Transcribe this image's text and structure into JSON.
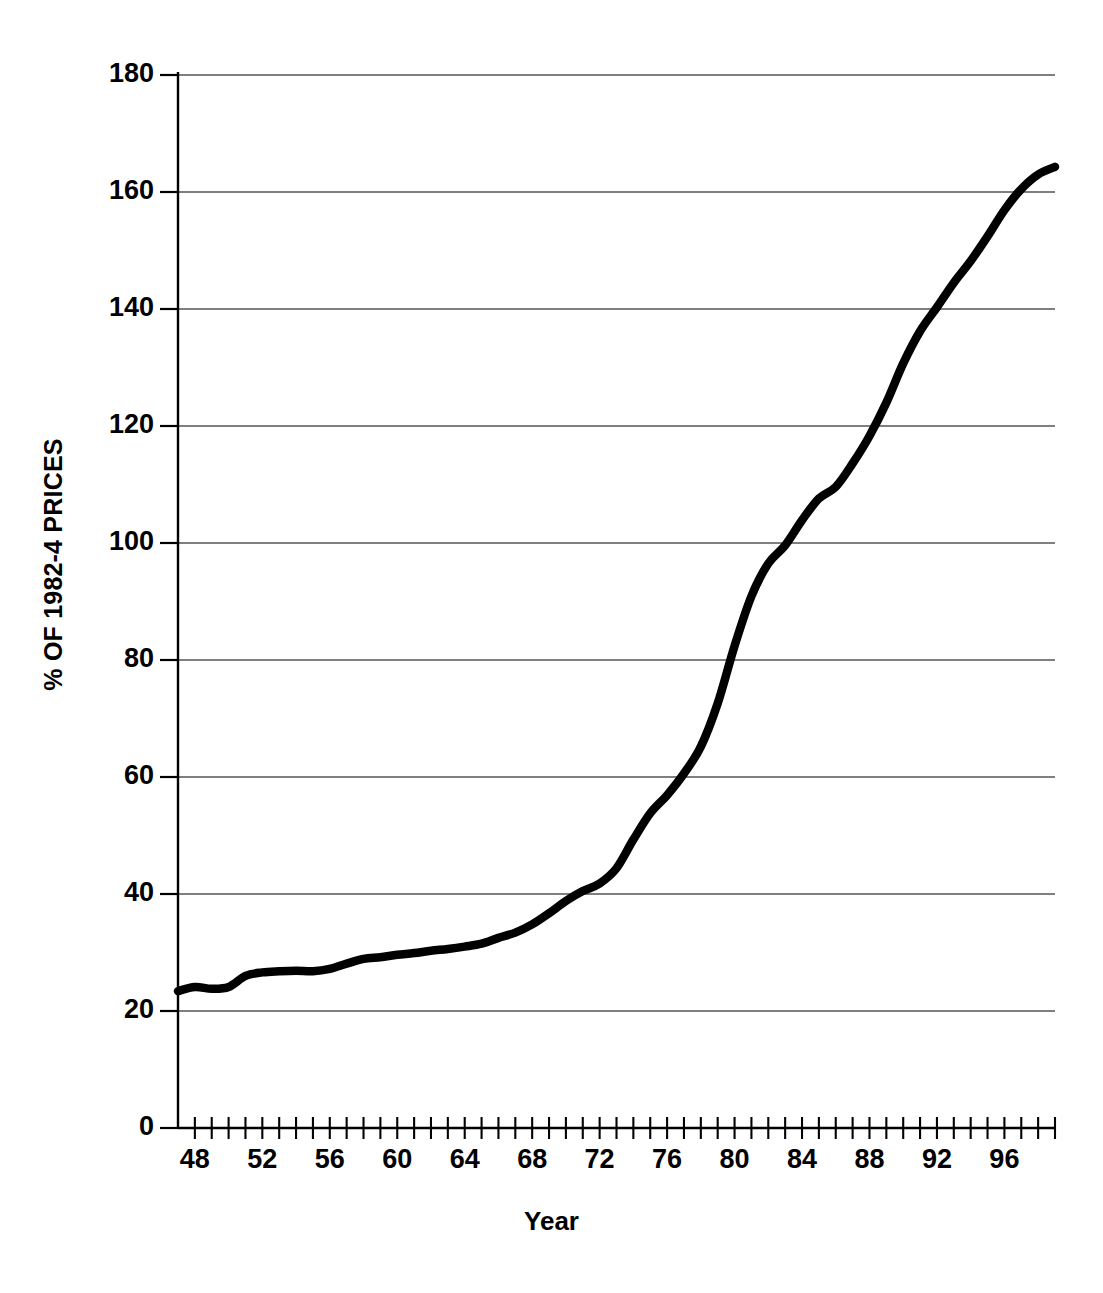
{
  "chart_data": {
    "type": "line",
    "title": "",
    "xlabel": "Year",
    "ylabel": "% OF 1982-4 PRICES",
    "xlim": [
      47,
      99
    ],
    "ylim": [
      0,
      180
    ],
    "grid": true,
    "legend": false,
    "legend_position": "none",
    "line_color": "#000000",
    "x_tick_labels": [
      "48",
      "52",
      "56",
      "60",
      "64",
      "68",
      "72",
      "76",
      "80",
      "84",
      "88",
      "92",
      "96"
    ],
    "x_tick_values": [
      48,
      52,
      56,
      60,
      64,
      68,
      72,
      76,
      80,
      84,
      88,
      92,
      96
    ],
    "x_minor_ticks_every": 1,
    "y_tick_labels": [
      "0",
      "20",
      "40",
      "60",
      "80",
      "100",
      "120",
      "140",
      "160",
      "180"
    ],
    "y_tick_values": [
      0,
      20,
      40,
      60,
      80,
      100,
      120,
      140,
      160,
      180
    ],
    "series": [
      {
        "name": "Consumer Price Index",
        "x": [
          47,
          48,
          49,
          50,
          51,
          52,
          53,
          54,
          55,
          56,
          57,
          58,
          59,
          60,
          61,
          62,
          63,
          64,
          65,
          66,
          67,
          68,
          69,
          70,
          71,
          72,
          73,
          74,
          75,
          76,
          77,
          78,
          79,
          80,
          81,
          82,
          83,
          84,
          85,
          86,
          87,
          88,
          89,
          90,
          91,
          92,
          93,
          94,
          95,
          96,
          97,
          98,
          99
        ],
        "values": [
          23.4,
          24.1,
          23.8,
          24.1,
          26.0,
          26.6,
          26.8,
          26.9,
          26.8,
          27.2,
          28.1,
          28.9,
          29.2,
          29.6,
          29.9,
          30.3,
          30.6,
          31.0,
          31.5,
          32.5,
          33.4,
          34.8,
          36.7,
          38.8,
          40.5,
          41.8,
          44.4,
          49.3,
          53.8,
          56.9,
          60.6,
          65.2,
          72.6,
          82.4,
          90.9,
          96.5,
          99.6,
          103.9,
          107.6,
          109.6,
          113.6,
          118.3,
          124.0,
          130.7,
          136.2,
          140.3,
          144.5,
          148.2,
          152.4,
          156.9,
          160.5,
          163.0,
          164.3
        ],
        "style": "solid",
        "linewidth": 8.5
      }
    ]
  }
}
